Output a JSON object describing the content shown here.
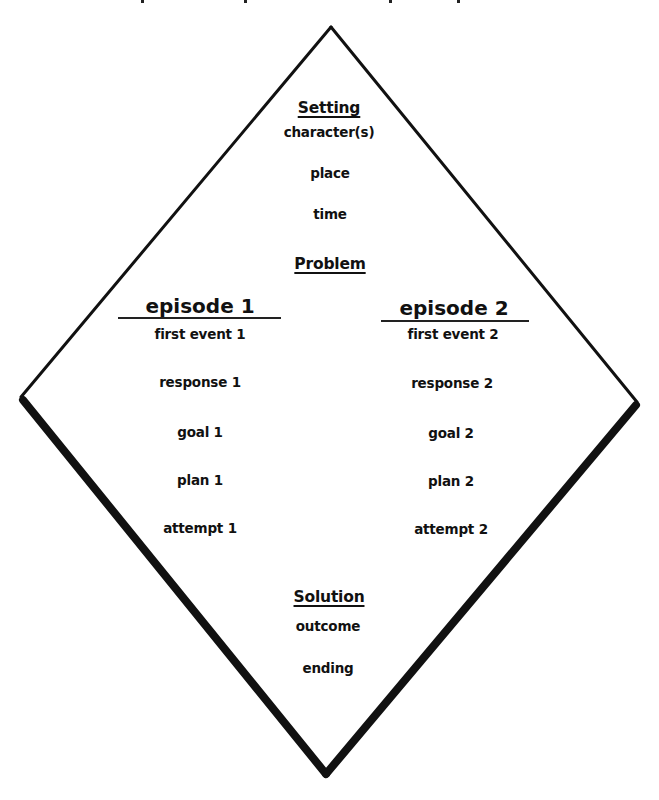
{
  "diagram": {
    "shape": "diamond",
    "colors": {
      "line": "#111111",
      "text": "#111111",
      "background": "#ffffff"
    },
    "setting": {
      "heading": "Setting",
      "items": [
        "character(s)",
        "place",
        "time"
      ]
    },
    "problem": {
      "heading": "Problem"
    },
    "episodes": [
      {
        "title": "episode 1",
        "items": [
          "first event 1",
          "response 1",
          "goal 1",
          "plan 1",
          "attempt 1"
        ]
      },
      {
        "title": "episode 2",
        "items": [
          "first event 2",
          "response 2",
          "goal 2",
          "plan 2",
          "attempt 2"
        ]
      }
    ],
    "solution": {
      "heading": "Solution",
      "items": [
        "outcome",
        "ending"
      ]
    }
  }
}
